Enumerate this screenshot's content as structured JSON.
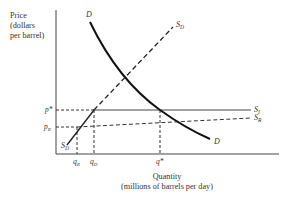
{
  "diagram": {
    "type": "supply-demand",
    "y_axis": {
      "label_lines": [
        "Price",
        "(dollars",
        "per barrel)"
      ],
      "ticks": [
        {
          "label": "p*",
          "sub": "",
          "level": "world_price"
        },
        {
          "label": "p",
          "sub": "R",
          "level": "restricted_price"
        }
      ]
    },
    "x_axis": {
      "label_lines": [
        "Quantity",
        "(millions of barrels per day)"
      ],
      "ticks": [
        {
          "label": "q",
          "sub": "R"
        },
        {
          "label": "q",
          "sub": "D"
        },
        {
          "label": "q*",
          "sub": ""
        }
      ]
    },
    "curves": [
      {
        "name": "D",
        "label": "D",
        "sub": "",
        "style": "solid",
        "shape": "downward-convex",
        "label_positions": [
          "top",
          "bottom"
        ]
      },
      {
        "name": "S_D",
        "label": "S",
        "sub": "D",
        "style": "dashed",
        "shape": "upward-line",
        "label_positions": [
          "top",
          "bottom"
        ]
      },
      {
        "name": "S_I",
        "label": "S",
        "sub": "I",
        "style": "solid",
        "shape": "horizontal"
      },
      {
        "name": "S_R",
        "label": "S",
        "sub": "R",
        "style": "dashed",
        "shape": "slightly-upward"
      }
    ],
    "colors": {
      "curve": "#222222",
      "axis": "#444444",
      "text": "#333333"
    }
  }
}
